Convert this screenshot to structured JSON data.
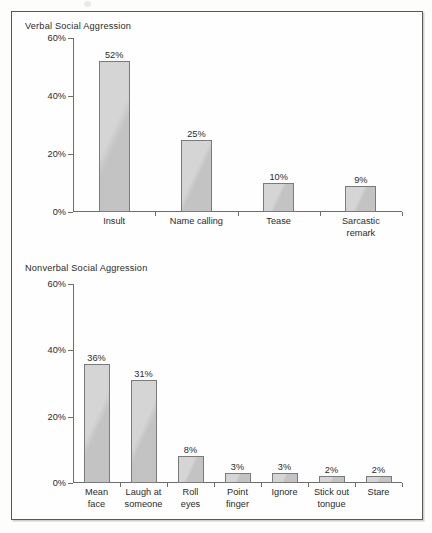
{
  "figure": {
    "background_color": "#fdfdfc",
    "frame_color": "#595959",
    "bar_fill_color": "#c9c9c9",
    "bar_border_color": "#7a7a7a",
    "text_color": "#2b2b2b",
    "axis_color": "#6e6e6e"
  },
  "panels": [
    {
      "title": "Verbal Social Aggression",
      "y_ticks": [
        "0%",
        "20%",
        "40%",
        "60%"
      ]
    },
    {
      "title": "Nonverbal Social Aggression",
      "y_ticks": [
        "0%",
        "20%",
        "40%",
        "60%"
      ]
    }
  ],
  "chart_data": [
    {
      "type": "bar",
      "title": "Verbal Social Aggression",
      "xlabel": "",
      "ylabel": "",
      "ylim": [
        0,
        60
      ],
      "ytick_values": [
        0,
        20,
        40,
        60
      ],
      "ytick_labels": [
        "0%",
        "20%",
        "40%",
        "60%"
      ],
      "grid": false,
      "legend": "none",
      "categories": [
        "Insult",
        "Name calling",
        "Tease",
        "Sarcastic remark"
      ],
      "category_label_lines": [
        [
          "Insult"
        ],
        [
          "Name calling"
        ],
        [
          "Tease"
        ],
        [
          "Sarcastic",
          "remark"
        ]
      ],
      "values": [
        52,
        25,
        10,
        9
      ],
      "value_labels": [
        "52%",
        "25%",
        "10%",
        "9%"
      ]
    },
    {
      "type": "bar",
      "title": "Nonverbal Social Aggression",
      "xlabel": "",
      "ylabel": "",
      "ylim": [
        0,
        60
      ],
      "ytick_values": [
        0,
        20,
        40,
        60
      ],
      "ytick_labels": [
        "0%",
        "20%",
        "40%",
        "60%"
      ],
      "grid": false,
      "legend": "none",
      "categories": [
        "Mean face",
        "Laugh at someone",
        "Roll eyes",
        "Point finger",
        "Ignore",
        "Stick out tongue",
        "Stare"
      ],
      "category_label_lines": [
        [
          "Mean",
          "face"
        ],
        [
          "Laugh at",
          "someone"
        ],
        [
          "Roll",
          "eyes"
        ],
        [
          "Point",
          "finger"
        ],
        [
          "Ignore"
        ],
        [
          "Stick out",
          "tongue"
        ],
        [
          "Stare"
        ]
      ],
      "values": [
        36,
        31,
        8,
        3,
        3,
        2,
        2
      ],
      "value_labels": [
        "36%",
        "31%",
        "8%",
        "3%",
        "3%",
        "2%",
        "2%"
      ]
    }
  ]
}
